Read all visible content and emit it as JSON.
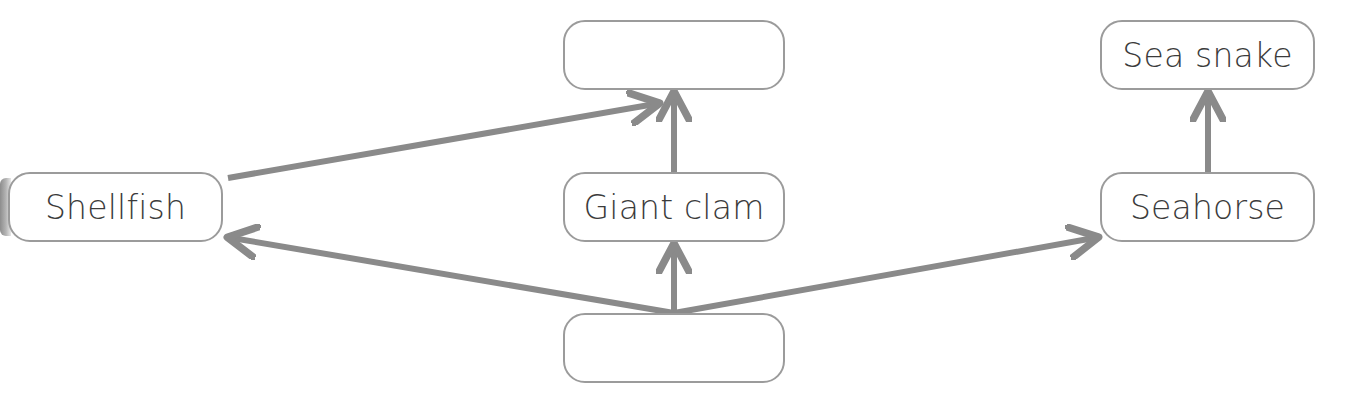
{
  "diagram": {
    "type": "food-web-flow-diagram",
    "canvas": {
      "width": 1355,
      "height": 406
    },
    "style": {
      "node_fill": "#ffffff",
      "node_border": "#9b9b9b",
      "connector_color": "#8a8a8a",
      "text_color": "#3b3b3b"
    },
    "nodes": [
      {
        "id": "shellfish",
        "label": "Shellfish",
        "blank": false,
        "x": 8,
        "y": 172,
        "width": 215,
        "height": 70
      },
      {
        "id": "top-center-blank",
        "label": "",
        "blank": true,
        "x": 563,
        "y": 20,
        "width": 222,
        "height": 70
      },
      {
        "id": "giant-clam",
        "label": "Giant clam",
        "blank": false,
        "x": 563,
        "y": 172,
        "width": 222,
        "height": 70
      },
      {
        "id": "bottom-center-blank",
        "label": "",
        "blank": true,
        "x": 563,
        "y": 313,
        "width": 222,
        "height": 70
      },
      {
        "id": "sea-snake",
        "label": "Sea snake",
        "blank": false,
        "x": 1100,
        "y": 20,
        "width": 215,
        "height": 70
      },
      {
        "id": "seahorse",
        "label": "Seahorse",
        "blank": false,
        "x": 1100,
        "y": 172,
        "width": 215,
        "height": 70
      }
    ],
    "connectors": [
      {
        "id": "shellfish-to-top-blank",
        "from": "shellfish",
        "to": "top-center-blank",
        "direction": "up-right",
        "x1": 228,
        "y1": 178,
        "x2": 655,
        "y2": 104
      },
      {
        "id": "giant-clam-to-top-blank",
        "from": "giant-clam",
        "to": "top-center-blank",
        "direction": "up",
        "x1": 674,
        "y1": 172,
        "x2": 674,
        "y2": 94
      },
      {
        "id": "bottom-blank-to-giant-clam",
        "from": "bottom-center-blank",
        "to": "giant-clam",
        "direction": "up",
        "x1": 674,
        "y1": 313,
        "x2": 674,
        "y2": 246
      },
      {
        "id": "bottom-blank-to-shellfish",
        "from": "bottom-center-blank",
        "to": "shellfish",
        "direction": "up-left",
        "x1": 674,
        "y1": 313,
        "x2": 228,
        "y2": 238
      },
      {
        "id": "bottom-blank-to-seahorse",
        "from": "bottom-center-blank",
        "to": "seahorse",
        "direction": "up-right",
        "x1": 674,
        "y1": 313,
        "x2": 1098,
        "y2": 238
      },
      {
        "id": "seahorse-to-sea-snake",
        "from": "seahorse",
        "to": "sea-snake",
        "direction": "up",
        "x1": 1208,
        "y1": 172,
        "x2": 1208,
        "y2": 94
      }
    ]
  }
}
